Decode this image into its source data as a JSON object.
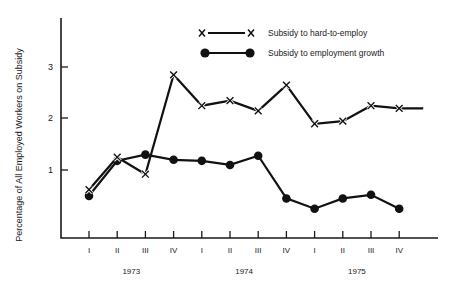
{
  "chart_data": {
    "type": "line",
    "title": "",
    "xlabel": "",
    "ylabel": "Percentage of All Employed Workers on Subsidy",
    "ylim": [
      0,
      3.6
    ],
    "yticks": [
      1,
      2,
      3
    ],
    "ytick_labels": [
      "1",
      "2",
      "3"
    ],
    "grid": false,
    "legend_position": "top-center",
    "categories": [
      "I",
      "II",
      "III",
      "IV",
      "I",
      "II",
      "III",
      "IV",
      "I",
      "II",
      "III",
      "IV"
    ],
    "year_groups": [
      {
        "label": "1973",
        "quarters": [
          "I",
          "II",
          "III",
          "IV"
        ]
      },
      {
        "label": "1974",
        "quarters": [
          "I",
          "II",
          "III",
          "IV"
        ]
      },
      {
        "label": "1975",
        "quarters": [
          "I",
          "II",
          "III",
          "IV"
        ]
      }
    ],
    "series": [
      {
        "name": "Subsidy to hard-to-employ",
        "marker": "x",
        "values": [
          0.62,
          1.25,
          0.92,
          2.85,
          2.25,
          2.35,
          2.15,
          2.65,
          1.9,
          1.95,
          2.25,
          2.2
        ]
      },
      {
        "name": "Subsidy to employment growth",
        "marker": "dot",
        "values": [
          0.5,
          1.18,
          1.3,
          1.2,
          1.18,
          1.1,
          1.28,
          0.45,
          0.25,
          0.45,
          0.52,
          0.25
        ]
      }
    ]
  },
  "legend": {
    "items": [
      {
        "label": "Subsidy to hard-to-employ",
        "marker": "x"
      },
      {
        "label": "Subsidy to employment growth",
        "marker": "dot"
      }
    ]
  },
  "axes": {
    "y_title": "Percentage of All Employed Workers on Subsidy",
    "y_tick_labels": [
      "3",
      "2",
      "1"
    ],
    "x_tick_labels": [
      "I",
      "II",
      "III",
      "IV",
      "I",
      "II",
      "III",
      "IV",
      "I",
      "II",
      "III",
      "IV"
    ],
    "year_labels": [
      "1973",
      "1974",
      "1975"
    ]
  },
  "colors": {
    "ink": "#111111",
    "background": "#ffffff"
  }
}
